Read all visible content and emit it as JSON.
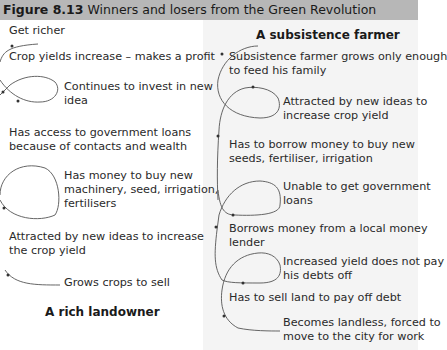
{
  "figure": {
    "label": "Figure 8.13",
    "title": "Winners and losers from the Green Revolution"
  },
  "rich_landowner": {
    "title": "A rich landowner",
    "steps": [
      "Get richer",
      "Crop yields increase – makes a profit",
      "Continues to invest in new",
      "idea",
      "Has access to government loans",
      "because of contacts and wealth",
      "Has money to buy new",
      "machinery, seed, irrigation,",
      "fertilisers",
      "Attracted by new ideas to increase",
      "the crop yield",
      "Grows crops to sell"
    ]
  },
  "subsistence_farmer": {
    "title": "A subsistence farmer",
    "steps": [
      "Subsistence farmer grows only enough",
      "to feed his family",
      "Attracted by new ideas to",
      "increase crop yield",
      "Has to borrow money to buy new",
      "seeds, fertiliser, irrigation",
      "Unable to get government",
      "loans",
      "Borrows money from a local money",
      "lender",
      "Increased yield does not pay",
      "his debts off",
      "Has to sell land to pay off debt",
      "Becomes landless, forced to",
      "move to the city for work"
    ]
  },
  "colors": {
    "header_bg": "#b7b7b7",
    "right_panel_bg": "#f4f4f4",
    "arrow": "#555555"
  }
}
